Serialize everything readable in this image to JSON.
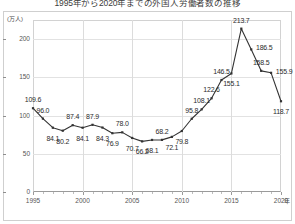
{
  "title": "1995年から2020年までの外国人労働者数の推移",
  "axis": {
    "y_unit": "(万人)",
    "x_unit": "年",
    "y_ticks": [
      0,
      50,
      100,
      150,
      200
    ],
    "x_ticks": [
      1995,
      2000,
      2005,
      2010,
      2015,
      2020
    ]
  },
  "chart_data": {
    "type": "line",
    "title": "1995年から2020年までの外国人労働者数の推移",
    "xlabel": "年",
    "ylabel": "(万人)",
    "xlim": [
      1995,
      2020
    ],
    "ylim": [
      0,
      225
    ],
    "grid": true,
    "legend": "none",
    "marker": "square",
    "line_color": "#333333",
    "x": [
      1995,
      1996,
      1997,
      1998,
      1999,
      2000,
      2001,
      2002,
      2003,
      2004,
      2005,
      2006,
      2007,
      2008,
      2009,
      2010,
      2011,
      2012,
      2013,
      2014,
      2015,
      2016,
      2017,
      2018,
      2019,
      2020
    ],
    "values": [
      109.6,
      96.0,
      84.1,
      80.2,
      87.4,
      84.1,
      87.9,
      84.3,
      76.9,
      78.0,
      70.7,
      66.2,
      68.1,
      68.2,
      72.1,
      79.8,
      95.8,
      108.1,
      122.6,
      146.5,
      155.1,
      213.7,
      186.5,
      158.5,
      155.9,
      118.7
    ],
    "point_labels": [
      "109.6",
      "96.0",
      "84.1",
      "80.2",
      "87.4",
      "84.1",
      "87.9",
      "84.3",
      "76.9",
      "78.0",
      "70.7",
      "66.2",
      "68.1",
      "68.2",
      "72.1",
      "79.8",
      "95.8",
      "108.1",
      "122.6",
      "146.5",
      "155.1",
      "213.7",
      "186.5",
      "158.5",
      "155.9",
      "118.7"
    ],
    "label_positions": [
      "above",
      "above",
      "below",
      "below",
      "above",
      "below",
      "above",
      "below",
      "below",
      "above",
      "below",
      "below",
      "below",
      "above",
      "below",
      "below",
      "above",
      "above",
      "above",
      "above",
      "below",
      "above",
      "right",
      "above",
      "right",
      "below"
    ]
  }
}
